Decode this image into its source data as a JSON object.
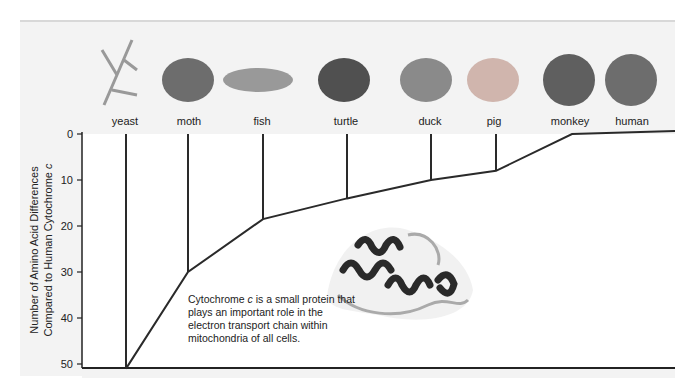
{
  "organisms": [
    {
      "name": "yeast",
      "differences": 51,
      "icon": "yeast-icon"
    },
    {
      "name": "moth",
      "differences": 30,
      "icon": "moth-icon"
    },
    {
      "name": "fish",
      "differences": 18.5,
      "icon": "fish-icon"
    },
    {
      "name": "turtle",
      "differences": 14,
      "icon": "turtle-icon"
    },
    {
      "name": "duck",
      "differences": 10,
      "icon": "duck-icon"
    },
    {
      "name": "pig",
      "differences": 8,
      "icon": "pig-icon"
    },
    {
      "name": "monkey",
      "differences": 0,
      "icon": "monkey-icon"
    },
    {
      "name": "human",
      "differences": 0,
      "icon": "human-icon"
    }
  ],
  "axis": {
    "title_line1": "Number of Amino Acid Differences",
    "title_line2": "Compared to Human Cytochrome c",
    "ticks": [
      "0",
      "10",
      "20",
      "30",
      "40",
      "50"
    ],
    "range": [
      0,
      50
    ]
  },
  "caption": {
    "part1": "Cytochrome ",
    "italic": "c",
    "part2": " is a small protein that plays an important role in the electron transport chain within mitochondria of all cells."
  },
  "protein_image_label": "cytochrome-c-protein-structure"
}
